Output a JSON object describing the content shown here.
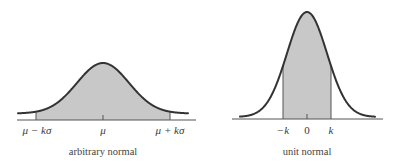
{
  "colors": {
    "curve": "#333333",
    "fill": "#c8c8c8",
    "axis": "#555555",
    "boundary": "#555555",
    "text": "#3a3a3a"
  },
  "panels": [
    {
      "id": "arbitrary",
      "caption": "arbitrary normal",
      "ticks": [
        {
          "label": "μ − kσ",
          "x": 37
        },
        {
          "label": "μ",
          "x": 103
        },
        {
          "label": "μ + kσ",
          "x": 170
        }
      ],
      "geometry": {
        "axis_x": [
          17,
          196
        ],
        "axis_y": 120,
        "curve_x": [
          18,
          188
        ],
        "peak_x": 103,
        "peak_y": 63,
        "base_y": 113.5,
        "sigma_px": 26,
        "shade_x": [
          36,
          170
        ],
        "center_tick_x": 103
      }
    },
    {
      "id": "unit",
      "caption": "unit normal",
      "ticks": [
        {
          "label": "−k",
          "x": 283
        },
        {
          "label": "0",
          "x": 307
        },
        {
          "label": "k",
          "x": 331
        }
      ],
      "geometry": {
        "axis_x": [
          232,
          383
        ],
        "axis_y": 119,
        "curve_x": [
          240,
          375
        ],
        "peak_x": 307,
        "peak_y": 12,
        "base_y": 117,
        "sigma_px": 20,
        "shade_x": [
          283,
          331
        ],
        "center_tick_x": 307
      }
    }
  ],
  "chart_data": [
    {
      "type": "area",
      "title": "arbitrary normal",
      "xlabel": "",
      "ylabel": "",
      "distribution": "normal(μ, σ)",
      "shaded_interval": [
        "μ − kσ",
        "μ + kσ"
      ],
      "tick_labels": [
        "μ − kσ",
        "μ",
        "μ + kσ"
      ],
      "grid": false,
      "legend": null
    },
    {
      "type": "area",
      "title": "unit normal",
      "xlabel": "",
      "ylabel": "",
      "distribution": "normal(0, 1)",
      "shaded_interval": [
        "−k",
        "k"
      ],
      "tick_labels": [
        "−k",
        "0",
        "k"
      ],
      "grid": false,
      "legend": null
    }
  ]
}
